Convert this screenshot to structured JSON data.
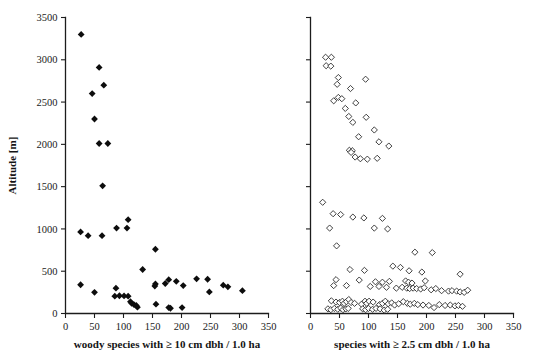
{
  "figure": {
    "title": "",
    "background_color": "#ffffff",
    "panel_count": 2
  },
  "chart_data": [
    {
      "type": "scatter",
      "panel": "left",
      "title": "",
      "xlabel": "woody species with ≥ 10 cm dbh / 1.0 ha",
      "ylabel": "Altitude [m]",
      "xlim": [
        0,
        350
      ],
      "ylim": [
        0,
        3500
      ],
      "xticks": [
        0,
        50,
        100,
        150,
        200,
        250,
        300,
        350
      ],
      "xtick_labels": [
        "0",
        "50",
        "100",
        "150",
        "200",
        "250",
        "300",
        "350"
      ],
      "yticks": [
        0,
        500,
        1000,
        1500,
        2000,
        2500,
        3000,
        3500
      ],
      "ytick_labels": [
        "0",
        "500",
        "1000",
        "1500",
        "2000",
        "2500",
        "3000",
        "3500"
      ],
      "grid": false,
      "legend": null,
      "marker": "filled-diamond",
      "marker_color": "#0d0d0d",
      "points": [
        [
          27,
          3300
        ],
        [
          58,
          2910
        ],
        [
          46,
          2600
        ],
        [
          66,
          2700
        ],
        [
          50,
          2300
        ],
        [
          58,
          2010
        ],
        [
          73,
          2010
        ],
        [
          64,
          1510
        ],
        [
          108,
          1110
        ],
        [
          88,
          1010
        ],
        [
          106,
          1010
        ],
        [
          26,
          965
        ],
        [
          39,
          920
        ],
        [
          63,
          920
        ],
        [
          155,
          760
        ],
        [
          133,
          520
        ],
        [
          226,
          410
        ],
        [
          245,
          405
        ],
        [
          178,
          400
        ],
        [
          191,
          380
        ],
        [
          155,
          350
        ],
        [
          172,
          355
        ],
        [
          26,
          340
        ],
        [
          203,
          330
        ],
        [
          154,
          325
        ],
        [
          272,
          335
        ],
        [
          280,
          315
        ],
        [
          87,
          300
        ],
        [
          305,
          270
        ],
        [
          248,
          255
        ],
        [
          50,
          250
        ],
        [
          85,
          205
        ],
        [
          93,
          210
        ],
        [
          101,
          208
        ],
        [
          108,
          205
        ],
        [
          112,
          140
        ],
        [
          114,
          120
        ],
        [
          118,
          105
        ],
        [
          122,
          95
        ],
        [
          124,
          75
        ],
        [
          156,
          110
        ],
        [
          178,
          70
        ],
        [
          181,
          62
        ],
        [
          201,
          70
        ]
      ]
    },
    {
      "type": "scatter",
      "panel": "right",
      "title": "",
      "xlabel": "species with ≥ 2.5 cm dbh / 1.0 ha",
      "ylabel": "Altitude [m]",
      "xlim": [
        0,
        350
      ],
      "ylim": [
        0,
        3500
      ],
      "xticks": [
        0,
        50,
        100,
        150,
        200,
        250,
        300,
        350
      ],
      "xtick_labels": [
        "0",
        "50",
        "100",
        "150",
        "200",
        "250",
        "300",
        "350"
      ],
      "yticks": [
        0,
        500,
        1000,
        1500,
        2000,
        2500,
        3000,
        3500
      ],
      "ytick_labels": [
        "",
        "",
        "",
        "",
        "",
        "",
        "",
        ""
      ],
      "grid": false,
      "legend": null,
      "marker": "open-diamond",
      "marker_color": "#ffffff",
      "marker_edge_color": "#2b2b2b",
      "points": [
        [
          26,
          3030
        ],
        [
          36,
          3030
        ],
        [
          27,
          2930
        ],
        [
          35,
          2925
        ],
        [
          48,
          2790
        ],
        [
          46,
          2710
        ],
        [
          95,
          2770
        ],
        [
          69,
          2660
        ],
        [
          48,
          2555
        ],
        [
          54,
          2540
        ],
        [
          40,
          2515
        ],
        [
          60,
          2425
        ],
        [
          78,
          2490
        ],
        [
          66,
          2330
        ],
        [
          96,
          2320
        ],
        [
          73,
          2260
        ],
        [
          110,
          2170
        ],
        [
          83,
          2090
        ],
        [
          118,
          2030
        ],
        [
          135,
          1980
        ],
        [
          67,
          1930
        ],
        [
          72,
          1925
        ],
        [
          70,
          1905
        ],
        [
          77,
          1850
        ],
        [
          86,
          1830
        ],
        [
          98,
          1825
        ],
        [
          115,
          1835
        ],
        [
          21,
          1315
        ],
        [
          39,
          1180
        ],
        [
          52,
          1170
        ],
        [
          73,
          1140
        ],
        [
          92,
          1130
        ],
        [
          124,
          1125
        ],
        [
          33,
          1010
        ],
        [
          110,
          1010
        ],
        [
          133,
          1000
        ],
        [
          45,
          800
        ],
        [
          180,
          725
        ],
        [
          210,
          720
        ],
        [
          142,
          560
        ],
        [
          155,
          545
        ],
        [
          68,
          520
        ],
        [
          93,
          510
        ],
        [
          170,
          505
        ],
        [
          192,
          490
        ],
        [
          258,
          465
        ],
        [
          44,
          400
        ],
        [
          84,
          395
        ],
        [
          112,
          375
        ],
        [
          124,
          370
        ],
        [
          136,
          380
        ],
        [
          164,
          385
        ],
        [
          169,
          370
        ],
        [
          175,
          360
        ],
        [
          198,
          385
        ],
        [
          40,
          330
        ],
        [
          62,
          330
        ],
        [
          103,
          320
        ],
        [
          118,
          320
        ],
        [
          131,
          310
        ],
        [
          148,
          300
        ],
        [
          158,
          310
        ],
        [
          166,
          300
        ],
        [
          171,
          295
        ],
        [
          177,
          300
        ],
        [
          183,
          295
        ],
        [
          190,
          290
        ],
        [
          196,
          305
        ],
        [
          208,
          280
        ],
        [
          216,
          295
        ],
        [
          226,
          270
        ],
        [
          238,
          265
        ],
        [
          244,
          270
        ],
        [
          252,
          265
        ],
        [
          258,
          255
        ],
        [
          265,
          250
        ],
        [
          271,
          275
        ],
        [
          36,
          150
        ],
        [
          44,
          135
        ],
        [
          50,
          130
        ],
        [
          55,
          145
        ],
        [
          58,
          120
        ],
        [
          62,
          140
        ],
        [
          66,
          165
        ],
        [
          70,
          130
        ],
        [
          76,
          120
        ],
        [
          88,
          110
        ],
        [
          94,
          145
        ],
        [
          97,
          120
        ],
        [
          101,
          145
        ],
        [
          108,
          135
        ],
        [
          119,
          105
        ],
        [
          124,
          120
        ],
        [
          129,
          145
        ],
        [
          134,
          115
        ],
        [
          140,
          125
        ],
        [
          145,
          100
        ],
        [
          152,
          115
        ],
        [
          160,
          140
        ],
        [
          167,
          120
        ],
        [
          172,
          110
        ],
        [
          179,
          120
        ],
        [
          185,
          105
        ],
        [
          194,
          100
        ],
        [
          204,
          95
        ],
        [
          213,
          70
        ],
        [
          222,
          105
        ],
        [
          232,
          95
        ],
        [
          241,
          100
        ],
        [
          249,
          90
        ],
        [
          255,
          95
        ],
        [
          262,
          85
        ],
        [
          30,
          55
        ],
        [
          35,
          45
        ],
        [
          41,
          60
        ],
        [
          47,
          50
        ],
        [
          52,
          65
        ],
        [
          56,
          45
        ],
        [
          61,
          55
        ],
        [
          65,
          60
        ],
        [
          90,
          55
        ],
        [
          95,
          45
        ],
        [
          100,
          60
        ],
        [
          107,
          50
        ],
        [
          113,
          60
        ],
        [
          120,
          55
        ],
        [
          127,
          40
        ],
        [
          133,
          50
        ]
      ]
    }
  ]
}
